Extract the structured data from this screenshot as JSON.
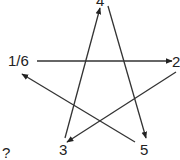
{
  "diagram": {
    "type": "pentagram-sequence",
    "stroke_color": "#333333",
    "text_color": "#222222",
    "nodes": [
      {
        "id": "n16",
        "label": "1/6",
        "x": 8,
        "y": 53
      },
      {
        "id": "n2",
        "label": "2",
        "x": 172,
        "y": 54
      },
      {
        "id": "n3",
        "label": "3",
        "x": 59,
        "y": 142
      },
      {
        "id": "n4",
        "label": "4",
        "x": 96,
        "y": -7
      },
      {
        "id": "n5",
        "label": "5",
        "x": 140,
        "y": 142
      }
    ],
    "question": {
      "label": "?",
      "x": 2,
      "y": 145
    },
    "edges": [
      {
        "from": "1/6",
        "to": "2",
        "x1": 37,
        "y1": 61,
        "x2": 172,
        "y2": 61
      },
      {
        "from": "2",
        "to": "3",
        "x1": 176,
        "y1": 72,
        "x2": 67,
        "y2": 142
      },
      {
        "from": "3",
        "to": "4",
        "x1": 65,
        "y1": 138,
        "x2": 100,
        "y2": 8
      },
      {
        "from": "4",
        "to": "5",
        "x1": 108,
        "y1": 6,
        "x2": 146,
        "y2": 138
      },
      {
        "from": "5",
        "to": "1/6",
        "x1": 135,
        "y1": 142,
        "x2": 22,
        "y2": 74
      }
    ]
  }
}
